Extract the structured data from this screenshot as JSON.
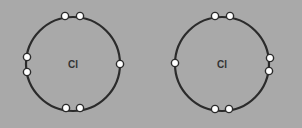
{
  "diagram": {
    "title": "",
    "background": "#a9a9a9",
    "atoms": [
      {
        "label": "Cl",
        "center": [
          73,
          64
        ],
        "radius": 47,
        "electrons": [
          [
            65,
            16
          ],
          [
            80,
            16
          ],
          [
            27,
            57
          ],
          [
            27,
            72
          ],
          [
            120,
            64
          ],
          [
            66,
            108
          ],
          [
            80,
            108
          ]
        ]
      },
      {
        "label": "Cl",
        "center": [
          222,
          64
        ],
        "radius": 47,
        "electrons": [
          [
            215,
            16
          ],
          [
            230,
            16
          ],
          [
            175,
            63
          ],
          [
            270,
            58
          ],
          [
            269,
            71
          ],
          [
            215,
            109
          ],
          [
            229,
            109
          ]
        ]
      }
    ]
  }
}
